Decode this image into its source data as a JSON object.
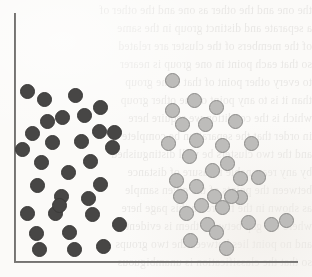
{
  "figure": {
    "background_color": "#fbfaf8",
    "width": 312,
    "height": 277
  },
  "axes": {
    "axis_color": "#6d6c6a",
    "y_axis_label": "",
    "x_axis_label": "",
    "y_axis": {
      "x": 14,
      "top": 13,
      "bottom": 262
    },
    "x_axis": {
      "y": 261,
      "left": 14,
      "right": 298
    }
  },
  "ghost_text": {
    "description": "Faint mirrored bleed-through text from the reverse side of the scanned page; not legible.",
    "lines": [
      {
        "top": 4,
        "text": "the one and the other as one and the other of"
      },
      {
        "top": 22,
        "text": "a separate and distinct group in the same"
      },
      {
        "top": 40,
        "text": "of the members of the cluster are related"
      },
      {
        "top": 58,
        "text": "so that each point in one group is nearer"
      },
      {
        "top": 76,
        "text": "to every other point of that same group"
      },
      {
        "top": 94,
        "text": "than it is to any point of the other group"
      },
      {
        "top": 112,
        "text": "which is the condition we require here"
      },
      {
        "top": 130,
        "text": "in order that the separation be complete"
      },
      {
        "top": 148,
        "text": "and the two clusters be well distinguished"
      },
      {
        "top": 166,
        "text": "by any reasonable measure of distance"
      },
      {
        "top": 184,
        "text": "between the points of the given sample"
      },
      {
        "top": 202,
        "text": "as shown in the figure on this page here"
      },
      {
        "top": 220,
        "text": "where the gap between them is evident"
      },
      {
        "top": 238,
        "text": "and no point lies between the two groups"
      },
      {
        "top": 256,
        "text": "so that the classification is unambiguous"
      }
    ]
  },
  "legend": {
    "visible": false,
    "entries": [
      {
        "label": "Cluster A",
        "color": "#474645"
      },
      {
        "label": "Cluster B",
        "color": "#bdbcba"
      }
    ]
  },
  "chart_data": {
    "type": "scatter",
    "subtitle": "",
    "xlabel": "",
    "ylabel": "",
    "xlim": [
      14,
      298
    ],
    "ylim": [
      13,
      261
    ],
    "grid": false,
    "legend_position": "none",
    "axes_style": "left-and-bottom-spines-only",
    "marker_size_px": 15,
    "note": "Point coordinates are given in pixel space of the figure: x measured rightward from the left edge, y measured downward from the top edge. Marker diameter is approximately 15 px for both series.",
    "series": [
      {
        "name": "Cluster A",
        "label": "Cluster A",
        "color": "#474645",
        "edge_color": "#3a3938",
        "marker": "filled-circle",
        "count": 31,
        "points": [
          {
            "x": 27,
            "y": 91
          },
          {
            "x": 44,
            "y": 99
          },
          {
            "x": 75,
            "y": 95
          },
          {
            "x": 100,
            "y": 107
          },
          {
            "x": 62,
            "y": 117
          },
          {
            "x": 84,
            "y": 115
          },
          {
            "x": 32,
            "y": 133
          },
          {
            "x": 52,
            "y": 142
          },
          {
            "x": 81,
            "y": 141
          },
          {
            "x": 99,
            "y": 131
          },
          {
            "x": 114,
            "y": 132
          },
          {
            "x": 41,
            "y": 162
          },
          {
            "x": 90,
            "y": 161
          },
          {
            "x": 68,
            "y": 172
          },
          {
            "x": 37,
            "y": 185
          },
          {
            "x": 100,
            "y": 184
          },
          {
            "x": 61,
            "y": 196
          },
          {
            "x": 88,
            "y": 198
          },
          {
            "x": 27,
            "y": 213
          },
          {
            "x": 55,
            "y": 213
          },
          {
            "x": 92,
            "y": 214
          },
          {
            "x": 119,
            "y": 224
          },
          {
            "x": 36,
            "y": 233
          },
          {
            "x": 69,
            "y": 232
          },
          {
            "x": 103,
            "y": 246
          },
          {
            "x": 39,
            "y": 249
          },
          {
            "x": 74,
            "y": 249
          },
          {
            "x": 47,
            "y": 121
          },
          {
            "x": 22,
            "y": 149
          },
          {
            "x": 112,
            "y": 147
          },
          {
            "x": 59,
            "y": 205
          }
        ]
      },
      {
        "name": "Cluster B",
        "label": "Cluster B",
        "color": "#bdbcba",
        "edge_color": "#8b8a88",
        "marker": "open-circle",
        "count": 32,
        "points": [
          {
            "x": 172,
            "y": 80
          },
          {
            "x": 194,
            "y": 100
          },
          {
            "x": 172,
            "y": 110
          },
          {
            "x": 216,
            "y": 107
          },
          {
            "x": 205,
            "y": 124
          },
          {
            "x": 235,
            "y": 121
          },
          {
            "x": 168,
            "y": 143
          },
          {
            "x": 196,
            "y": 140
          },
          {
            "x": 222,
            "y": 145
          },
          {
            "x": 251,
            "y": 143
          },
          {
            "x": 189,
            "y": 156
          },
          {
            "x": 227,
            "y": 163
          },
          {
            "x": 212,
            "y": 170
          },
          {
            "x": 176,
            "y": 180
          },
          {
            "x": 240,
            "y": 178
          },
          {
            "x": 258,
            "y": 177
          },
          {
            "x": 196,
            "y": 186
          },
          {
            "x": 214,
            "y": 196
          },
          {
            "x": 240,
            "y": 197
          },
          {
            "x": 201,
            "y": 205
          },
          {
            "x": 222,
            "y": 207
          },
          {
            "x": 186,
            "y": 213
          },
          {
            "x": 231,
            "y": 196
          },
          {
            "x": 207,
            "y": 224
          },
          {
            "x": 248,
            "y": 222
          },
          {
            "x": 271,
            "y": 224
          },
          {
            "x": 286,
            "y": 220
          },
          {
            "x": 190,
            "y": 240
          },
          {
            "x": 226,
            "y": 248
          },
          {
            "x": 180,
            "y": 196
          },
          {
            "x": 182,
            "y": 124
          },
          {
            "x": 216,
            "y": 232
          }
        ]
      }
    ]
  }
}
